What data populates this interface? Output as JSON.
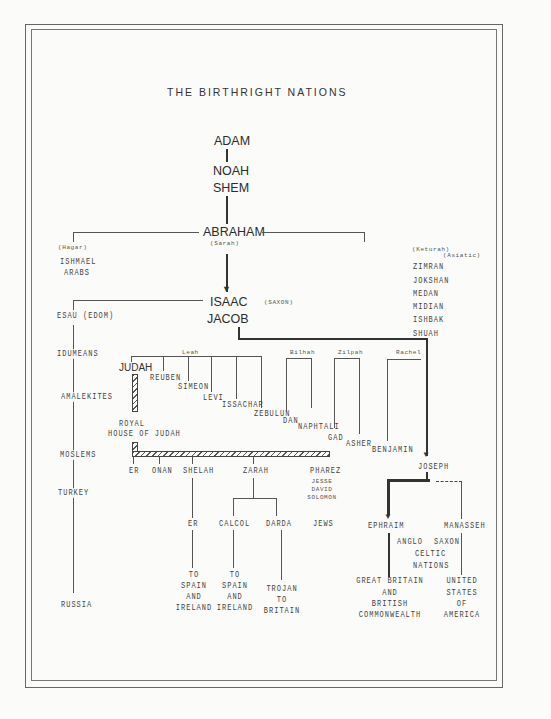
{
  "title": "THE BIRTHRIGHT NATIONS",
  "main_line": {
    "adam": "ADAM",
    "noah": "NOAH",
    "shem": "SHEM",
    "abraham": "ABRAHAM",
    "sarah": "(Sarah)",
    "isaac": "ISAAC",
    "saxon": "(SAXON)",
    "jacob": "JACOB"
  },
  "hagar_branch": {
    "wife": "(Hagar)",
    "items": [
      "ISHMAEL",
      "ARABS"
    ]
  },
  "keturah_branch": {
    "wife": "(Keturah)",
    "note": "(Asiatic)",
    "items": [
      "ZIMRAN",
      "JOKSHAN",
      "MEDAN",
      "MIDIAN",
      "ISHBAK",
      "SHUAH"
    ]
  },
  "esau_branch": {
    "head": "ESAU (EDOM)",
    "items": [
      "IDUMEANS",
      "AMALEKITES",
      "MOSLEMS",
      "TURKEY",
      "RUSSIA"
    ]
  },
  "mothers": {
    "leah": "Leah",
    "bilhah": "Bilhah",
    "zilpah": "Zilpah",
    "rachel": "Rachel"
  },
  "tribes": {
    "judah": "JUDAH",
    "reuben": "REUBEN",
    "simeon": "SIMEON",
    "levi": "LEVI",
    "issachar": "ISSACHAR",
    "zebulun": "ZEBULUN",
    "dan": "DAN",
    "naphtali": "NAPHTALI",
    "gad": "GAD",
    "asher": "ASHER",
    "benjamin": "BENJAMIN",
    "joseph": "JOSEPH"
  },
  "royal_house": [
    "ROYAL",
    "HOUSE OF JUDAH"
  ],
  "judah_sons": {
    "er": "ER",
    "onan": "ONAN",
    "shelah": "SHELAH",
    "zarah": "ZARAH",
    "pharez": "PHAREZ",
    "pharez_line": [
      "JESSE",
      "DAVID",
      "SOLOMON"
    ],
    "jews": "JEWS",
    "shelah_son": "ER",
    "zarah_sons": [
      "CALCOL",
      "DARDA"
    ]
  },
  "destinations": {
    "er": [
      "TO",
      "SPAIN",
      "AND",
      "IRELAND"
    ],
    "calcol": [
      "TO",
      "SPAIN",
      "AND",
      "IRELAND"
    ],
    "darda": [
      "TROJAN",
      "TO",
      "BRITAIN"
    ]
  },
  "joseph_sons": {
    "ephraim": "EPHRAIM",
    "manasseh": "MANASSEH",
    "peoples": [
      "ANGLO",
      "SAXON",
      "CELTIC",
      "NATIONS"
    ],
    "ephraim_nation": [
      "GREAT BRITAIN",
      "AND",
      "BRITISH",
      "COMMONWEALTH"
    ],
    "manasseh_nation": [
      "UNITED",
      "STATES",
      "OF",
      "AMERICA"
    ]
  }
}
